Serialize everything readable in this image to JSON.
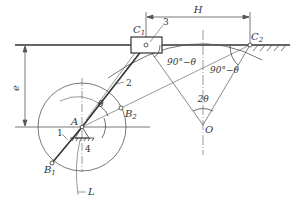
{
  "figure": {
    "type": "offset slider-crank mechanism with quick-return extreme positions",
    "colors": {
      "line": "#333333",
      "thin": "#555555",
      "background": "#ffffff"
    }
  },
  "points": {
    "A": "A",
    "B1": "B",
    "B1_sub": "1",
    "B2": "B",
    "B2_sub": "2",
    "C1": "C",
    "C1_sub": "1",
    "C2": "C",
    "C2_sub": "2",
    "O": "O"
  },
  "parts": {
    "crank": "1",
    "coupler": "2",
    "slider": "3",
    "frame": "4"
  },
  "labels": {
    "H": "H",
    "e": "e",
    "theta": "θ",
    "two_theta": "2θ",
    "angle_c1": "90°−θ",
    "angle_c2": "90°−θ",
    "L": "L"
  }
}
